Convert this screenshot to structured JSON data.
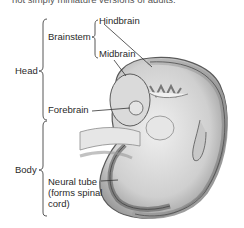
{
  "caption": "not simply miniature versions of adults.",
  "labels": {
    "head": "Head",
    "body": "Body",
    "brainstem": "Brainstem",
    "hindbrain": "Hindbrain",
    "midbrain": "Midbrain",
    "forebrain": "Forebrain",
    "neural_tube_line1": "Neural tube",
    "neural_tube_line2": "(forms spinal",
    "neural_tube_line3": "cord)"
  },
  "colors": {
    "text": "#2a2a2a",
    "outline": "#555555",
    "embryo_fill": "#d4d4d4",
    "embryo_dark": "#8a8a8a",
    "background": "#ffffff"
  }
}
